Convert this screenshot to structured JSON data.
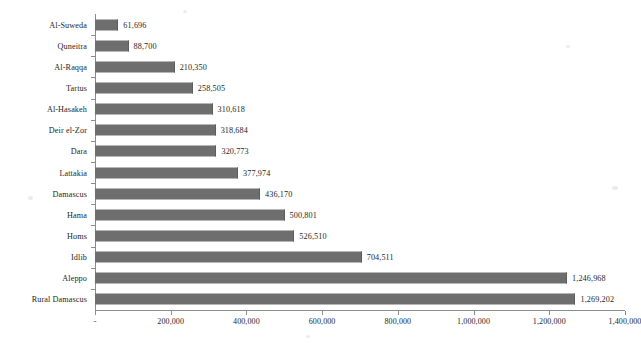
{
  "chart_data": {
    "type": "bar",
    "orientation": "horizontal",
    "title": "",
    "subtitle": "",
    "xlabel": "",
    "ylabel": "",
    "grid": false,
    "legend": false,
    "legend_position": "none",
    "bar_color": "#6e6e6e",
    "axis_color": "#8d8d8d",
    "xlim": [
      0,
      1400000
    ],
    "xticks": [
      0,
      200000,
      400000,
      600000,
      800000,
      1000000,
      1200000,
      1400000
    ],
    "xtick_labels": [
      "-",
      "200,000",
      "400,000",
      "600,000",
      "800,000",
      "1,000,000",
      "1,200,000",
      "1,400,000"
    ],
    "categories": [
      "Al-Suweda",
      "Quneitra",
      "Al-Raqqa",
      "Tartus",
      "Al-Hasakeh",
      "Deir el-Zor",
      "Dara",
      "Lattakia",
      "Damascus",
      "Hama",
      "Homs",
      "Idlib",
      "Aleppo",
      "Rural Damascus"
    ],
    "values": [
      61696,
      88700,
      210350,
      258505,
      310618,
      318684,
      320773,
      377974,
      436170,
      500801,
      526510,
      704511,
      1246968,
      1269202
    ],
    "data_labels": [
      "61,696",
      "88,700",
      "210,350",
      "258,505",
      "310,618",
      "318,684",
      "320,773",
      "377,974",
      "436,170",
      "500,801",
      "526,510",
      "704,511",
      "1,246,968",
      "1,269,202"
    ]
  }
}
